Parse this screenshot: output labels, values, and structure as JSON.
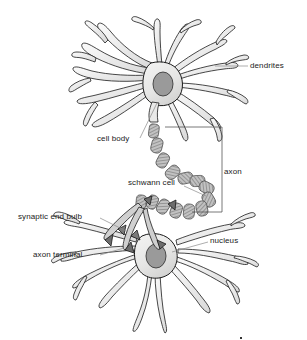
{
  "figure": {
    "background_color": "#ffffff",
    "outline_color": "#1a1a1a",
    "cell_fill_color": "#ececeb",
    "nucleus_fill_color": "#9a9a9a",
    "myelin_fill_color": "#b8b8b8",
    "label_color": "#222222",
    "leader_line_color": "#8a8a8a"
  },
  "labels": {
    "dendrites": "dendrites",
    "cell_body": "cell body",
    "axon": "axon",
    "schwann_cell": "schwann cell",
    "synaptic_end_bulb": "synaptic end bulb",
    "axon_terminal": "axon terminal",
    "nucleus": "nucleus"
  },
  "parts": [
    {
      "id": "dendrites",
      "label": "dendrites",
      "icon": "branching-dendrite-icon"
    },
    {
      "id": "cell-body",
      "label": "cell body",
      "icon": "soma-icon"
    },
    {
      "id": "nucleus",
      "label": "nucleus",
      "icon": "nucleus-oval-icon"
    },
    {
      "id": "axon",
      "label": "axon",
      "icon": "axon-bracket-icon"
    },
    {
      "id": "schwann-cell",
      "label": "schwann cell",
      "icon": "myelin-segment-icon"
    },
    {
      "id": "synaptic-end-bulb",
      "label": "synaptic end bulb",
      "icon": "end-bulb-icon"
    },
    {
      "id": "axon-terminal",
      "label": "axon terminal",
      "icon": "terminal-branch-icon"
    }
  ]
}
